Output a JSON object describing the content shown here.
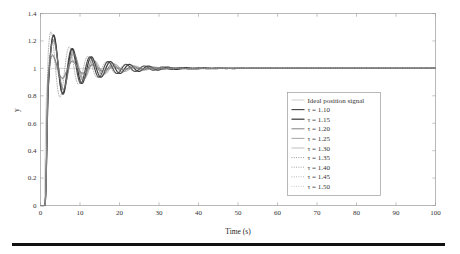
{
  "chart_data": {
    "type": "line",
    "title": "",
    "xlabel": "Time (s)",
    "ylabel": "y",
    "xlim": [
      0,
      100
    ],
    "ylim": [
      0,
      1.4
    ],
    "xticks": [
      0,
      10,
      20,
      30,
      40,
      50,
      60,
      70,
      80,
      90,
      100
    ],
    "yticks": [
      0,
      0.2,
      0.4,
      0.6,
      0.8,
      1,
      1.2,
      1.4
    ],
    "xtick_labels": [
      "0",
      "10",
      "20",
      "30",
      "40",
      "50",
      "60",
      "70",
      "80",
      "90",
      "100"
    ],
    "ytick_labels": [
      "0",
      "0.2",
      "0.4",
      "0.6",
      "0.8",
      "1",
      "1.2",
      "1.4"
    ],
    "grid": false,
    "legend_position": "center-right",
    "legend_entries": [
      {
        "label": "Ideal position signal",
        "style": "solid",
        "width": 0.7,
        "color": "#b9b9b9"
      },
      {
        "label": "τ = 1.10",
        "style": "solid",
        "width": 1.15,
        "color": "#4a4a4a"
      },
      {
        "label": "τ = 1.15",
        "style": "solid",
        "width": 1.25,
        "color": "#3d3d3d"
      },
      {
        "label": "τ = 1.20",
        "style": "solid",
        "width": 0.85,
        "color": "#6a6a6a"
      },
      {
        "label": "τ = 1.25",
        "style": "solid",
        "width": 0.7,
        "color": "#7e7e7e"
      },
      {
        "label": "τ = 1.30",
        "style": "solid",
        "width": 0.6,
        "color": "#949494"
      },
      {
        "label": "τ = 1.35",
        "style": "dotted",
        "width": 0.7,
        "color": "#5c5c5c"
      },
      {
        "label": "τ = 1.40",
        "style": "dotted",
        "width": 0.7,
        "color": "#6d6d6d"
      },
      {
        "label": "τ = 1.45",
        "style": "dotted",
        "width": 0.65,
        "color": "#8a8a8a"
      },
      {
        "label": "τ = 1.50",
        "style": "dotted",
        "width": 0.6,
        "color": "#a0a0a0"
      }
    ],
    "series": [
      {
        "name": "Ideal position signal",
        "final_value": 1.0,
        "overshoot": 0.0,
        "rise_time": 1.6,
        "damping": 1.0,
        "period": 0.0,
        "decay": 0.0
      },
      {
        "name": "τ = 1.10",
        "final_value": 1.0,
        "overshoot": 0.24,
        "rise_time": 2.3,
        "damping": 0.22,
        "period": 4.6,
        "decay": 0.115,
        "phase": 0.0
      },
      {
        "name": "τ = 1.15",
        "final_value": 1.0,
        "overshoot": 0.245,
        "rise_time": 2.35,
        "damping": 0.21,
        "period": 4.8,
        "decay": 0.112,
        "phase": 0.12
      },
      {
        "name": "τ = 1.20",
        "final_value": 1.0,
        "overshoot": 0.21,
        "rise_time": 2.4,
        "damping": 0.23,
        "period": 5.0,
        "decay": 0.118,
        "phase": 0.26
      },
      {
        "name": "τ = 1.25",
        "final_value": 1.0,
        "overshoot": 0.2,
        "rise_time": 2.45,
        "damping": 0.24,
        "period": 5.2,
        "decay": 0.122,
        "phase": 0.4
      },
      {
        "name": "τ = 1.30",
        "final_value": 1.0,
        "overshoot": 0.095,
        "rise_time": 2.5,
        "damping": 0.3,
        "period": 5.0,
        "decay": 0.135,
        "phase": 0.55
      },
      {
        "name": "τ = 1.35",
        "final_value": 1.0,
        "overshoot": 0.1,
        "rise_time": 2.55,
        "damping": 0.3,
        "period": 5.1,
        "decay": 0.133,
        "phase": 0.7
      },
      {
        "name": "τ = 1.40",
        "final_value": 1.0,
        "overshoot": 0.105,
        "rise_time": 2.6,
        "damping": 0.29,
        "period": 5.3,
        "decay": 0.13,
        "phase": 0.86
      },
      {
        "name": "τ = 1.45",
        "final_value": 1.0,
        "overshoot": 0.28,
        "rise_time": 2.2,
        "damping": 0.2,
        "period": 4.7,
        "decay": 0.125,
        "phase": 1.02
      },
      {
        "name": "τ = 1.50",
        "final_value": 1.0,
        "overshoot": 0.115,
        "rise_time": 2.65,
        "damping": 0.28,
        "period": 5.4,
        "decay": 0.128,
        "phase": 1.18
      }
    ],
    "annotations": {
      "settling_time_approx": 30,
      "peak_value_max": 1.28,
      "peak_time_approx": 7.5,
      "min_trough_approx": 0.62
    }
  },
  "figure": {
    "background_color": "#ffffff",
    "axis_color": "#9a9a9a",
    "bottom_rule_color": "#111111"
  }
}
